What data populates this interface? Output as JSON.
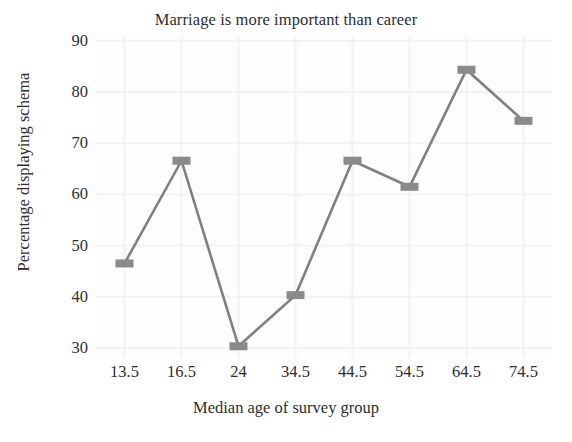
{
  "chart_data": {
    "type": "line",
    "title": "Marriage is more important than career",
    "xlabel": "Median age of survey group",
    "ylabel": "Percentage displaying schema",
    "categories": [
      "13.5",
      "16.5",
      "24",
      "34.5",
      "44.5",
      "54.5",
      "64.5",
      "74.5"
    ],
    "values": [
      46.5,
      66.6,
      30.3,
      40.3,
      66.6,
      61.5,
      84.4,
      74.4
    ],
    "ylim": [
      28,
      91
    ],
    "yticks": [
      30,
      40,
      50,
      60,
      70,
      80,
      90
    ],
    "ytick_labels": [
      "30",
      "40",
      "50",
      "60",
      "70",
      "80",
      "90"
    ],
    "grid": true,
    "legend": false,
    "series": [
      {
        "name": "Percentage displaying schema",
        "values": [
          46.5,
          66.6,
          30.3,
          40.3,
          66.6,
          61.5,
          84.4,
          74.4
        ],
        "color": "#808080",
        "marker": "square"
      }
    ],
    "colors": {
      "line": "#808080",
      "marker": "#8a8a8a",
      "text": "#2e2e2e",
      "grid": "#f2f2f2",
      "background": "#ffffff",
      "plot_background": "#fdfdfd"
    }
  }
}
